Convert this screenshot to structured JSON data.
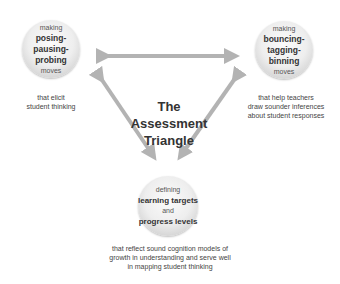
{
  "title": [
    "The",
    "Assessment",
    "Triangle"
  ],
  "nodes": {
    "left": {
      "top": "making",
      "bold": [
        "posing-",
        "pausing-",
        "probing"
      ],
      "bottom": "moves",
      "caption": [
        "that elicit",
        "student thinking"
      ]
    },
    "right": {
      "top": "making",
      "bold": [
        "bouncing-",
        "tagging-",
        "binning"
      ],
      "bottom": "moves",
      "caption": [
        "that help teachers",
        "draw sounder inferences",
        "about student responses"
      ]
    },
    "bottom": {
      "top": "defining",
      "bold1": "learning targets",
      "mid": "and",
      "bold2": "progress levels",
      "caption": [
        "that reflect sound cognition models of",
        "growth in understanding and serve well",
        "in mapping student thinking"
      ]
    }
  },
  "colors": {
    "arrow": "#b3b3b3",
    "circle": "#e6e6e6",
    "text": "#333333"
  }
}
